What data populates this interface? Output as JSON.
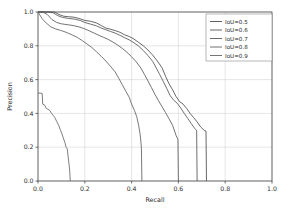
{
  "chart_data": {
    "type": "line",
    "title": "",
    "xlabel": "Recall",
    "ylabel": "Precision",
    "xlim": [
      0.0,
      1.0
    ],
    "ylim": [
      0.0,
      1.0
    ],
    "grid": true,
    "legend_position": "upper right",
    "xticks": [
      "0.0",
      "0.2",
      "0.4",
      "0.6",
      "0.8",
      "1.0"
    ],
    "yticks": [
      "0.0",
      "0.2",
      "0.4",
      "0.6",
      "0.8",
      "1.0"
    ],
    "xtick_values": [
      0.0,
      0.2,
      0.4,
      0.6,
      0.8,
      1.0
    ],
    "ytick_values": [
      0.0,
      0.2,
      0.4,
      0.6,
      0.8,
      1.0
    ],
    "line_color": "#4d4d4d",
    "series": [
      {
        "name": "IoU=0.5",
        "color": "#4d4d4d",
        "points": [
          [
            0.0,
            1.0
          ],
          [
            0.02,
            1.0
          ],
          [
            0.045,
            1.0
          ],
          [
            0.07,
            1.0
          ],
          [
            0.09,
            0.985
          ],
          [
            0.11,
            0.975
          ],
          [
            0.13,
            0.972
          ],
          [
            0.15,
            0.97
          ],
          [
            0.175,
            0.962
          ],
          [
            0.2,
            0.95
          ],
          [
            0.225,
            0.945
          ],
          [
            0.25,
            0.935
          ],
          [
            0.27,
            0.92
          ],
          [
            0.29,
            0.905
          ],
          [
            0.31,
            0.898
          ],
          [
            0.33,
            0.89
          ],
          [
            0.35,
            0.88
          ],
          [
            0.37,
            0.865
          ],
          [
            0.39,
            0.855
          ],
          [
            0.41,
            0.84
          ],
          [
            0.43,
            0.82
          ],
          [
            0.45,
            0.8
          ],
          [
            0.47,
            0.775
          ],
          [
            0.49,
            0.745
          ],
          [
            0.51,
            0.71
          ],
          [
            0.53,
            0.67
          ],
          [
            0.545,
            0.62
          ],
          [
            0.56,
            0.575
          ],
          [
            0.575,
            0.54
          ],
          [
            0.59,
            0.5
          ],
          [
            0.605,
            0.47
          ],
          [
            0.62,
            0.455
          ],
          [
            0.635,
            0.43
          ],
          [
            0.65,
            0.4
          ],
          [
            0.665,
            0.375
          ],
          [
            0.68,
            0.35
          ],
          [
            0.695,
            0.32
          ],
          [
            0.71,
            0.3
          ],
          [
            0.718,
            0.295
          ],
          [
            0.72,
            0.0
          ]
        ]
      },
      {
        "name": "IoU=0.6",
        "color": "#555555",
        "points": [
          [
            0.0,
            1.0
          ],
          [
            0.02,
            1.0
          ],
          [
            0.045,
            1.0
          ],
          [
            0.065,
            0.995
          ],
          [
            0.085,
            0.978
          ],
          [
            0.105,
            0.968
          ],
          [
            0.13,
            0.962
          ],
          [
            0.155,
            0.958
          ],
          [
            0.18,
            0.95
          ],
          [
            0.2,
            0.938
          ],
          [
            0.225,
            0.928
          ],
          [
            0.25,
            0.918
          ],
          [
            0.27,
            0.905
          ],
          [
            0.29,
            0.895
          ],
          [
            0.31,
            0.885
          ],
          [
            0.33,
            0.875
          ],
          [
            0.35,
            0.862
          ],
          [
            0.37,
            0.848
          ],
          [
            0.39,
            0.835
          ],
          [
            0.41,
            0.818
          ],
          [
            0.43,
            0.798
          ],
          [
            0.45,
            0.772
          ],
          [
            0.47,
            0.742
          ],
          [
            0.49,
            0.708
          ],
          [
            0.505,
            0.67
          ],
          [
            0.52,
            0.63
          ],
          [
            0.535,
            0.59
          ],
          [
            0.55,
            0.548
          ],
          [
            0.565,
            0.505
          ],
          [
            0.58,
            0.478
          ],
          [
            0.595,
            0.46
          ],
          [
            0.61,
            0.432
          ],
          [
            0.625,
            0.4
          ],
          [
            0.64,
            0.37
          ],
          [
            0.655,
            0.34
          ],
          [
            0.67,
            0.31
          ],
          [
            0.678,
            0.3
          ],
          [
            0.68,
            0.0
          ]
        ]
      },
      {
        "name": "IoU=0.7",
        "color": "#5a5a5a",
        "points": [
          [
            0.0,
            1.0
          ],
          [
            0.02,
            1.0
          ],
          [
            0.04,
            0.985
          ],
          [
            0.06,
            0.955
          ],
          [
            0.08,
            0.938
          ],
          [
            0.1,
            0.93
          ],
          [
            0.125,
            0.925
          ],
          [
            0.15,
            0.92
          ],
          [
            0.175,
            0.912
          ],
          [
            0.2,
            0.9
          ],
          [
            0.22,
            0.888
          ],
          [
            0.24,
            0.875
          ],
          [
            0.26,
            0.862
          ],
          [
            0.28,
            0.85
          ],
          [
            0.3,
            0.838
          ],
          [
            0.32,
            0.822
          ],
          [
            0.34,
            0.805
          ],
          [
            0.36,
            0.785
          ],
          [
            0.38,
            0.762
          ],
          [
            0.4,
            0.735
          ],
          [
            0.42,
            0.705
          ],
          [
            0.44,
            0.668
          ],
          [
            0.455,
            0.63
          ],
          [
            0.47,
            0.592
          ],
          [
            0.485,
            0.552
          ],
          [
            0.5,
            0.512
          ],
          [
            0.515,
            0.475
          ],
          [
            0.53,
            0.44
          ],
          [
            0.545,
            0.405
          ],
          [
            0.56,
            0.368
          ],
          [
            0.575,
            0.33
          ],
          [
            0.59,
            0.27
          ],
          [
            0.598,
            0.245
          ],
          [
            0.6,
            0.0
          ]
        ]
      },
      {
        "name": "IoU=0.8",
        "color": "#606060",
        "points": [
          [
            0.0,
            1.0
          ],
          [
            0.018,
            0.96
          ],
          [
            0.035,
            0.935
          ],
          [
            0.055,
            0.912
          ],
          [
            0.075,
            0.9
          ],
          [
            0.095,
            0.892
          ],
          [
            0.12,
            0.88
          ],
          [
            0.145,
            0.865
          ],
          [
            0.17,
            0.848
          ],
          [
            0.19,
            0.83
          ],
          [
            0.21,
            0.81
          ],
          [
            0.23,
            0.79
          ],
          [
            0.25,
            0.765
          ],
          [
            0.27,
            0.738
          ],
          [
            0.29,
            0.71
          ],
          [
            0.31,
            0.678
          ],
          [
            0.33,
            0.645
          ],
          [
            0.345,
            0.608
          ],
          [
            0.36,
            0.57
          ],
          [
            0.375,
            0.532
          ],
          [
            0.39,
            0.495
          ],
          [
            0.4,
            0.455
          ],
          [
            0.412,
            0.418
          ],
          [
            0.422,
            0.38
          ],
          [
            0.43,
            0.33
          ],
          [
            0.436,
            0.28
          ],
          [
            0.44,
            0.23
          ],
          [
            0.442,
            0.19
          ],
          [
            0.444,
            0.0
          ]
        ]
      },
      {
        "name": "IoU=0.9",
        "color": "#666666",
        "points": [
          [
            0.0,
            0.52
          ],
          [
            0.01,
            0.52
          ],
          [
            0.018,
            0.518
          ],
          [
            0.02,
            0.455
          ],
          [
            0.028,
            0.45
          ],
          [
            0.035,
            0.43
          ],
          [
            0.042,
            0.425
          ],
          [
            0.05,
            0.418
          ],
          [
            0.058,
            0.4
          ],
          [
            0.065,
            0.388
          ],
          [
            0.072,
            0.375
          ],
          [
            0.08,
            0.352
          ],
          [
            0.088,
            0.33
          ],
          [
            0.095,
            0.305
          ],
          [
            0.102,
            0.28
          ],
          [
            0.108,
            0.255
          ],
          [
            0.115,
            0.228
          ],
          [
            0.12,
            0.2
          ],
          [
            0.125,
            0.19
          ],
          [
            0.13,
            0.13
          ],
          [
            0.135,
            0.07
          ],
          [
            0.138,
            0.0
          ]
        ]
      }
    ]
  },
  "legend": {
    "entries": [
      {
        "label": "IoU=0.5"
      },
      {
        "label": "IoU=0.6"
      },
      {
        "label": "IoU=0.7"
      },
      {
        "label": "IoU=0.8"
      },
      {
        "label": "IoU=0.9"
      }
    ]
  }
}
